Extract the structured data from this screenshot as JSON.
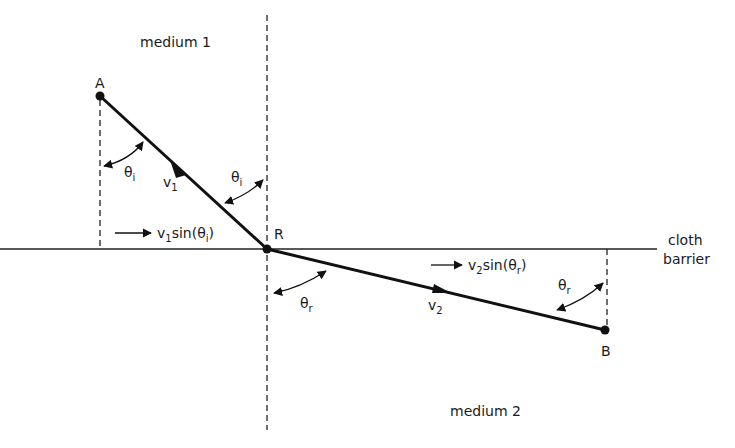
{
  "diagram": {
    "regions": {
      "top": "medium 1",
      "bottom": "medium 2"
    },
    "barrier_label": [
      "cloth",
      "barrier"
    ],
    "points": {
      "A": "A",
      "R": "R",
      "B": "B"
    },
    "velocities": {
      "v1": {
        "base": "v",
        "sub": "1"
      },
      "v2": {
        "base": "v",
        "sub": "2"
      }
    },
    "components": {
      "c1": {
        "pre": "v",
        "pre_sub": "1",
        "mid": "sin(θ",
        "sub": "i",
        "post": ")"
      },
      "c2": {
        "pre": "v",
        "pre_sub": "2",
        "mid": "sin(θ",
        "sub": "r",
        "post": ")"
      }
    },
    "angles": {
      "theta_i": {
        "base": "θ",
        "sub": "i"
      },
      "theta_r": {
        "base": "θ",
        "sub": "r"
      }
    },
    "colors": {
      "line": "#111111",
      "background": "#ffffff"
    }
  }
}
